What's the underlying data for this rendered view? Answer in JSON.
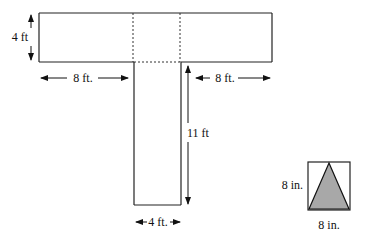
{
  "diagram": {
    "top_bar": {
      "height_label": "4 ft",
      "left_label": "8 ft.",
      "right_label": "8 ft."
    },
    "stem": {
      "height_label": "11 ft",
      "width_label": "4 ft."
    },
    "inset": {
      "side_label": "8 in.",
      "bottom_label": "8 in.",
      "fill_color": "#a8a8a8"
    },
    "colors": {
      "line": "#222222",
      "dotted": "#333333"
    }
  }
}
